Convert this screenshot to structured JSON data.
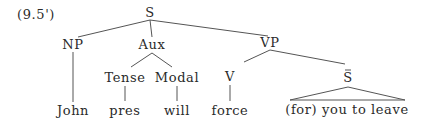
{
  "example_number": "(9.5')",
  "nodes": {
    "S": {
      "label": "S",
      "x": 150,
      "y": 17
    },
    "NP": {
      "label": "NP",
      "x": 73,
      "y": 49
    },
    "Aux": {
      "label": "Aux",
      "x": 152,
      "y": 49
    },
    "VP": {
      "label": "VP",
      "x": 270,
      "y": 47
    },
    "Tense": {
      "label": "Tense",
      "x": 125,
      "y": 82
    },
    "Modal": {
      "label": "Modal",
      "x": 177,
      "y": 82
    },
    "V": {
      "label": "V",
      "x": 230,
      "y": 81
    },
    "Sbar": {
      "label": "S",
      "x": 348,
      "y": 82
    },
    "John": {
      "label": "John",
      "x": 73,
      "y": 115
    },
    "pres": {
      "label": "pres",
      "x": 125,
      "y": 115
    },
    "will": {
      "label": "will",
      "x": 177,
      "y": 115
    },
    "force": {
      "label": "force",
      "x": 230,
      "y": 115
    },
    "clause": {
      "label": "(for) you to leave",
      "x": 347,
      "y": 114
    }
  },
  "edges": [
    {
      "x1": 150,
      "y1": 20,
      "x2": 78,
      "y2": 37
    },
    {
      "x1": 150,
      "y1": 20,
      "x2": 152,
      "y2": 37
    },
    {
      "x1": 150,
      "y1": 20,
      "x2": 268,
      "y2": 36
    },
    {
      "x1": 73,
      "y1": 52,
      "x2": 73,
      "y2": 102
    },
    {
      "x1": 152,
      "y1": 53,
      "x2": 131,
      "y2": 67
    },
    {
      "x1": 152,
      "y1": 53,
      "x2": 172,
      "y2": 67
    },
    {
      "x1": 270,
      "y1": 50,
      "x2": 244,
      "y2": 62
    },
    {
      "x1": 270,
      "y1": 50,
      "x2": 345,
      "y2": 64
    },
    {
      "x1": 125,
      "y1": 86,
      "x2": 125,
      "y2": 101
    },
    {
      "x1": 177,
      "y1": 86,
      "x2": 177,
      "y2": 101
    },
    {
      "x1": 230,
      "y1": 85,
      "x2": 230,
      "y2": 101
    }
  ],
  "triangle": {
    "apex_x": 348,
    "apex_y": 87,
    "left_x": 290,
    "right_x": 405,
    "base_y": 100
  }
}
